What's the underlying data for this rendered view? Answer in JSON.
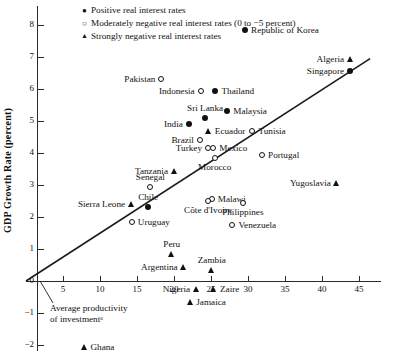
{
  "chart_data": {
    "type": "scatter",
    "title": "",
    "xlabel": "",
    "ylabel": "GDP Growth Rate (percent)",
    "xlim": [
      0,
      48
    ],
    "ylim": [
      -2.5,
      9.6
    ],
    "xticks": [
      5,
      10,
      15,
      20,
      25,
      30,
      35,
      40,
      45
    ],
    "yticks": [
      -2,
      -1,
      0,
      1,
      2,
      3,
      4,
      5,
      6,
      7,
      8,
      9
    ],
    "grid": false,
    "legend_position": "top-left",
    "legend": [
      {
        "marker": "filled-circle",
        "label": "Positive real interest rates"
      },
      {
        "marker": "open-circle",
        "label": "Moderately negative real interest rates (0 to −5 percent)"
      },
      {
        "marker": "triangle",
        "label": "Strongly negative real interest rates"
      }
    ],
    "annotations": [
      {
        "text_line1": "Average productivity",
        "text_line2": "of investmentᵃ"
      }
    ],
    "trendline": {
      "x0": 0,
      "y0": 0,
      "x1": 46.5,
      "y1": 6.95
    },
    "points": [
      {
        "name": "Republic of Korea",
        "x": 29.6,
        "y": 7.85,
        "marker": "filled-circle",
        "label_side": "right"
      },
      {
        "name": "Algeria",
        "x": 43.8,
        "y": 6.95,
        "marker": "triangle",
        "label_side": "left"
      },
      {
        "name": "Singapore",
        "x": 43.8,
        "y": 6.55,
        "marker": "filled-circle",
        "label_side": "left"
      },
      {
        "name": "Pakistan",
        "x": 18.3,
        "y": 6.3,
        "marker": "open-circle",
        "label_side": "left"
      },
      {
        "name": "Indonesia",
        "x": 23.6,
        "y": 5.95,
        "marker": "open-circle",
        "label_side": "left"
      },
      {
        "name": "Thailand",
        "x": 25.6,
        "y": 5.95,
        "marker": "filled-circle",
        "label_side": "right"
      },
      {
        "name": "Malaysia",
        "x": 27.2,
        "y": 5.3,
        "marker": "filled-circle",
        "label_side": "right"
      },
      {
        "name": "Sri Lanka",
        "x": 24.2,
        "y": 5.1,
        "marker": "filled-circle",
        "label_side": "top"
      },
      {
        "name": "India",
        "x": 22.0,
        "y": 4.9,
        "marker": "filled-circle",
        "label_side": "left"
      },
      {
        "name": "Tunisia",
        "x": 30.6,
        "y": 4.7,
        "marker": "open-circle",
        "label_side": "right"
      },
      {
        "name": "Ecuador",
        "x": 24.7,
        "y": 4.7,
        "marker": "triangle",
        "label_side": "right"
      },
      {
        "name": "Brazil",
        "x": 23.5,
        "y": 4.4,
        "marker": "open-circle",
        "label_side": "left"
      },
      {
        "name": "Turkey",
        "x": 24.6,
        "y": 4.15,
        "marker": "open-circle",
        "label_side": "left"
      },
      {
        "name": "Mexico",
        "x": 25.3,
        "y": 4.15,
        "marker": "open-circle",
        "label_side": "right"
      },
      {
        "name": "Morocco",
        "x": 25.5,
        "y": 3.85,
        "marker": "open-circle",
        "label_side": "bottom"
      },
      {
        "name": "Portugal",
        "x": 31.9,
        "y": 3.95,
        "marker": "open-circle",
        "label_side": "right"
      },
      {
        "name": "Tanzania",
        "x": 20.0,
        "y": 3.45,
        "marker": "triangle",
        "label_side": "left"
      },
      {
        "name": "Yugoslavia",
        "x": 42.0,
        "y": 3.05,
        "marker": "triangle",
        "label_side": "left"
      },
      {
        "name": "Senegal",
        "x": 16.8,
        "y": 2.95,
        "marker": "open-circle",
        "label_side": "top"
      },
      {
        "name": "Malawi",
        "x": 25.1,
        "y": 2.55,
        "marker": "open-circle",
        "label_side": "right"
      },
      {
        "name": "Côte d'Ivoire",
        "x": 24.6,
        "y": 2.5,
        "marker": "open-circle",
        "label_side": "bottom"
      },
      {
        "name": "Philippines",
        "x": 29.3,
        "y": 2.45,
        "marker": "open-circle",
        "label_side": "bottom"
      },
      {
        "name": "Chile",
        "x": 16.5,
        "y": 2.3,
        "marker": "filled-circle",
        "label_side": "top"
      },
      {
        "name": "Sierra Leone",
        "x": 14.2,
        "y": 2.4,
        "marker": "triangle",
        "label_side": "left"
      },
      {
        "name": "Uruguay",
        "x": 14.3,
        "y": 1.85,
        "marker": "open-circle",
        "label_side": "right"
      },
      {
        "name": "Venezuela",
        "x": 27.9,
        "y": 1.75,
        "marker": "open-circle",
        "label_side": "right"
      },
      {
        "name": "Peru",
        "x": 19.7,
        "y": 0.85,
        "marker": "triangle",
        "label_side": "top"
      },
      {
        "name": "Argentina",
        "x": 21.3,
        "y": 0.45,
        "marker": "triangle",
        "label_side": "left"
      },
      {
        "name": "Zambia",
        "x": 25.1,
        "y": 0.35,
        "marker": "triangle",
        "label_side": "top"
      },
      {
        "name": "Nigeria",
        "x": 23.0,
        "y": -0.25,
        "marker": "triangle",
        "label_side": "left"
      },
      {
        "name": "Zaire",
        "x": 25.4,
        "y": -0.25,
        "marker": "triangle",
        "label_side": "right"
      },
      {
        "name": "Jamaica",
        "x": 22.2,
        "y": -0.65,
        "marker": "triangle",
        "label_side": "right"
      },
      {
        "name": "Ghana",
        "x": 7.9,
        "y": -2.05,
        "marker": "triangle",
        "label_side": "right"
      }
    ]
  }
}
